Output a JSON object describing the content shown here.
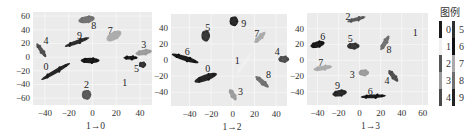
{
  "chart_data": [
    {
      "type": "scatter",
      "title": "",
      "xlabel": "1→0",
      "ylabel": "",
      "xlim": [
        -50,
        50
      ],
      "ylim": [
        -70,
        66
      ],
      "xticks": [
        -40,
        -20,
        0,
        20,
        40
      ],
      "yticks": [
        60,
        40,
        20,
        0,
        -20,
        -40,
        -60
      ],
      "grid": true,
      "clusters": [
        {
          "class": 8,
          "x": -5,
          "y": 55,
          "w": 7,
          "h": 5,
          "angle": -10,
          "label": {
            "text": "8",
            "x": 1,
            "y": 46
          }
        },
        {
          "class": 7,
          "x": 18,
          "y": 31,
          "w": 7,
          "h": 6,
          "angle": -30,
          "label": {
            "text": "7",
            "x": 15,
            "y": 39
          }
        },
        {
          "class": 9,
          "x": -13,
          "y": 22,
          "w": 11,
          "h": 3,
          "angle": -20,
          "label": {
            "text": "9",
            "x": -11,
            "y": 32
          }
        },
        {
          "class": 4,
          "x": -43,
          "y": 10,
          "w": 7,
          "h": 3,
          "angle": 55,
          "label": {
            "text": "4",
            "x": -39,
            "y": 25
          }
        },
        {
          "class": 3,
          "x": 43,
          "y": 7,
          "w": 7,
          "h": 4,
          "angle": -10,
          "label": {
            "text": "3",
            "x": 43,
            "y": 19
          }
        },
        {
          "class": 6,
          "x": -2,
          "y": -5,
          "w": 8,
          "h": 4,
          "angle": 0,
          "label": null
        },
        {
          "class": 6,
          "x": 32,
          "y": -1,
          "w": 6,
          "h": 2,
          "angle": 0,
          "label": null
        },
        {
          "class": 5,
          "x": 42,
          "y": -11,
          "w": 3,
          "h": 4,
          "angle": 0,
          "label": {
            "text": "5",
            "x": 37,
            "y": -17
          }
        },
        {
          "class": 0,
          "x": -31,
          "y": -21,
          "w": 14,
          "h": 3,
          "angle": -30,
          "label": {
            "text": "0",
            "x": -39,
            "y": -13
          }
        },
        {
          "class": 2,
          "x": -5,
          "y": -55,
          "w": 4,
          "h": 7,
          "angle": 0,
          "label": {
            "text": "2",
            "x": -5,
            "y": -40
          }
        },
        {
          "class": 1,
          "x": 27,
          "y": -33,
          "w": 0,
          "h": 0,
          "angle": 0,
          "label": {
            "text": "1",
            "x": 27,
            "y": -37
          }
        }
      ]
    },
    {
      "type": "scatter",
      "title": "",
      "xlabel": "1→2",
      "ylabel": "",
      "xlim": [
        -57,
        50
      ],
      "ylim": [
        -57,
        57
      ],
      "xticks": [
        -40,
        -20,
        0,
        20,
        40
      ],
      "yticks": [
        40,
        20,
        0,
        -20,
        -40
      ],
      "grid": true,
      "clusters": [
        {
          "class": 9,
          "x": 1,
          "y": 48,
          "w": 4,
          "h": 6,
          "angle": 0,
          "label": {
            "text": "9",
            "x": 10,
            "y": 45
          }
        },
        {
          "class": 5,
          "x": -25,
          "y": 30,
          "w": 4,
          "h": 7,
          "angle": 0,
          "label": {
            "text": "5",
            "x": -23,
            "y": 40
          }
        },
        {
          "class": 7,
          "x": 25,
          "y": 28,
          "w": 7,
          "h": 3,
          "angle": -45,
          "label": {
            "text": "7",
            "x": 22,
            "y": 33
          }
        },
        {
          "class": 6,
          "x": -44,
          "y": 2,
          "w": 13,
          "h": 3,
          "angle": 18,
          "label": {
            "text": "6",
            "x": -42,
            "y": 10
          }
        },
        {
          "class": 4,
          "x": 47,
          "y": 1,
          "w": 5,
          "h": 4,
          "angle": 0,
          "label": {
            "text": "4",
            "x": 41,
            "y": 11
          }
        },
        {
          "class": 1,
          "x": 10,
          "y": -5,
          "w": 11,
          "h": 2,
          "angle": -55,
          "label": {
            "text": "1",
            "x": 4,
            "y": -1
          }
        },
        {
          "class": 0,
          "x": -25,
          "y": -22,
          "w": 11,
          "h": 4,
          "angle": -20,
          "label": {
            "text": "0",
            "x": -23,
            "y": -11
          }
        },
        {
          "class": 8,
          "x": 27,
          "y": -27,
          "w": 8,
          "h": 3,
          "angle": 40,
          "label": {
            "text": "8",
            "x": 33,
            "y": -18
          }
        },
        {
          "class": 3,
          "x": 0,
          "y": -43,
          "w": 6,
          "h": 3,
          "angle": 60,
          "label": {
            "text": "3",
            "x": 7,
            "y": -39
          }
        }
      ]
    },
    {
      "type": "scatter",
      "title": "",
      "xlabel": "1→3",
      "ylabel": "",
      "xlim": [
        -50,
        65
      ],
      "ylim": [
        -57,
        60
      ],
      "xticks": [
        -40,
        -20,
        0,
        20,
        40,
        60
      ],
      "yticks": [
        40,
        20,
        0,
        -20,
        -40
      ],
      "grid": true,
      "clusters": [
        {
          "class": 2,
          "x": -3,
          "y": 52,
          "w": 9,
          "h": 2,
          "angle": -15,
          "label": {
            "text": "2",
            "x": -11,
            "y": 55
          }
        },
        {
          "class": 1,
          "x": 53,
          "y": 38,
          "w": 0,
          "h": 0,
          "angle": 0,
          "label": {
            "text": "1",
            "x": 53,
            "y": 35
          }
        },
        {
          "class": 6,
          "x": -40,
          "y": 20,
          "w": 7,
          "h": 4,
          "angle": -15,
          "label": {
            "text": "6",
            "x": -35,
            "y": 30
          }
        },
        {
          "class": 5,
          "x": -6,
          "y": 18,
          "w": 6,
          "h": 4,
          "angle": 0,
          "label": {
            "text": "5",
            "x": -9,
            "y": 28
          }
        },
        {
          "class": 8,
          "x": 24,
          "y": 22,
          "w": 8,
          "h": 3,
          "angle": -60,
          "label": {
            "text": "8",
            "x": 28,
            "y": 13
          }
        },
        {
          "class": 7,
          "x": -35,
          "y": -10,
          "w": 9,
          "h": 3,
          "angle": -10,
          "label": {
            "text": "7",
            "x": -37,
            "y": -3
          }
        },
        {
          "class": 3,
          "x": 4,
          "y": -16,
          "w": 5,
          "h": 4,
          "angle": 0,
          "label": {
            "text": "3",
            "x": -7,
            "y": -18
          }
        },
        {
          "class": 4,
          "x": 32,
          "y": -20,
          "w": 7,
          "h": 3,
          "angle": 50,
          "label": {
            "text": "4",
            "x": 26,
            "y": -26
          }
        },
        {
          "class": 9,
          "x": -19,
          "y": -42,
          "w": 7,
          "h": 4,
          "angle": -10,
          "label": {
            "text": "9",
            "x": -21,
            "y": -32
          }
        },
        {
          "class": 6,
          "x": 13,
          "y": -46,
          "w": 12,
          "h": 2,
          "angle": -3,
          "label": {
            "text": "6",
            "x": 10,
            "y": -40
          }
        }
      ]
    }
  ],
  "legend": {
    "title": "图例",
    "placement": "right",
    "entries": [
      {
        "label": "0",
        "color": "#1a1a1a"
      },
      {
        "label": "1",
        "color": "#f0f0f0"
      },
      {
        "label": "2",
        "color": "#555555"
      },
      {
        "label": "3",
        "color": "#9a9a9a"
      },
      {
        "label": "4",
        "color": "#4a4a4a"
      },
      {
        "label": "5",
        "color": "#303030"
      },
      {
        "label": "6",
        "color": "#111111"
      },
      {
        "label": "7",
        "color": "#aaaaaa"
      },
      {
        "label": "8",
        "color": "#6e6e6e"
      },
      {
        "label": "9",
        "color": "#222222"
      }
    ]
  },
  "style": {
    "plot_background": "#ebebeb",
    "grid_color": "#f7f7f7"
  }
}
